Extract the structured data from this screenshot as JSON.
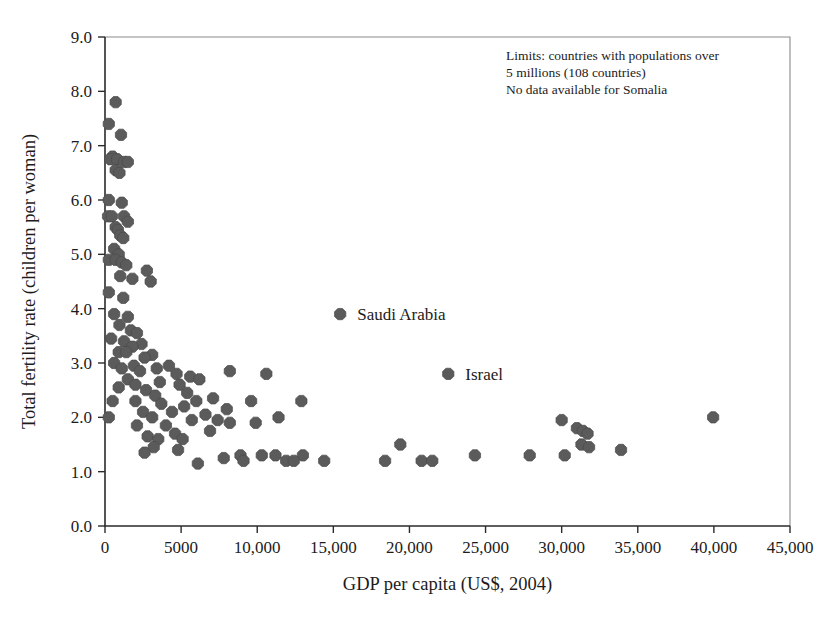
{
  "chart_data": {
    "type": "scatter",
    "title": "",
    "xlabel": "GDP per capita (US$, 2004)",
    "ylabel": "Total fertility rate (children per woman)",
    "xlim": [
      0,
      45000
    ],
    "ylim": [
      0,
      9
    ],
    "grid": false,
    "legend": "none",
    "marker_color": "#5b5b5b",
    "xticks": [
      0,
      5000,
      10000,
      15000,
      20000,
      25000,
      30000,
      35000,
      40000,
      45000
    ],
    "xticklabels": [
      "0",
      "5000",
      "10,000",
      "15,000",
      "20,000",
      "25,000",
      "30,000",
      "35,000",
      "40,000",
      "45,000"
    ],
    "yticks": [
      0,
      1,
      2,
      3,
      4,
      5,
      6,
      7,
      8,
      9
    ],
    "yticklabels": [
      "0.0",
      "1.0",
      "2.0",
      "3.0",
      "4.0",
      "5.0",
      "6.0",
      "7.0",
      "8.0",
      "9.0"
    ],
    "annotation_lines": [
      "Limits: countries with populations over",
      "5 millions (108 countries)",
      "No data available for Somalia"
    ],
    "labeled_points": [
      {
        "name": "Saudi Arabia",
        "x": 15450,
        "y": 3.9
      },
      {
        "name": "Israel",
        "x": 22550,
        "y": 2.8
      }
    ],
    "points": [
      [
        700,
        7.8
      ],
      [
        250,
        7.4
      ],
      [
        1050,
        7.2
      ],
      [
        500,
        6.8
      ],
      [
        350,
        6.75
      ],
      [
        800,
        6.75
      ],
      [
        1250,
        6.7
      ],
      [
        1500,
        6.7
      ],
      [
        700,
        6.55
      ],
      [
        950,
        6.5
      ],
      [
        250,
        6.0
      ],
      [
        1100,
        5.95
      ],
      [
        200,
        5.7
      ],
      [
        450,
        5.7
      ],
      [
        1250,
        5.7
      ],
      [
        1500,
        5.6
      ],
      [
        700,
        5.5
      ],
      [
        850,
        5.45
      ],
      [
        1000,
        5.35
      ],
      [
        1200,
        5.3
      ],
      [
        600,
        5.1
      ],
      [
        900,
        5.0
      ],
      [
        250,
        4.9
      ],
      [
        700,
        4.9
      ],
      [
        1100,
        4.85
      ],
      [
        1400,
        4.8
      ],
      [
        2750,
        4.7
      ],
      [
        1000,
        4.6
      ],
      [
        1800,
        4.55
      ],
      [
        3000,
        4.5
      ],
      [
        250,
        4.3
      ],
      [
        1200,
        4.2
      ],
      [
        600,
        3.9
      ],
      [
        1500,
        3.85
      ],
      [
        950,
        3.7
      ],
      [
        1700,
        3.6
      ],
      [
        2100,
        3.55
      ],
      [
        400,
        3.45
      ],
      [
        1250,
        3.4
      ],
      [
        2400,
        3.35
      ],
      [
        1800,
        3.3
      ],
      [
        900,
        3.2
      ],
      [
        1400,
        3.2
      ],
      [
        3100,
        3.15
      ],
      [
        2600,
        3.1
      ],
      [
        600,
        3.0
      ],
      [
        1900,
        2.95
      ],
      [
        4200,
        2.95
      ],
      [
        1100,
        2.9
      ],
      [
        3400,
        2.9
      ],
      [
        2300,
        2.85
      ],
      [
        8200,
        2.85
      ],
      [
        4700,
        2.8
      ],
      [
        10600,
        2.8
      ],
      [
        5600,
        2.75
      ],
      [
        1500,
        2.7
      ],
      [
        6200,
        2.7
      ],
      [
        3600,
        2.65
      ],
      [
        2000,
        2.6
      ],
      [
        4900,
        2.6
      ],
      [
        900,
        2.55
      ],
      [
        2700,
        2.5
      ],
      [
        5400,
        2.45
      ],
      [
        3300,
        2.4
      ],
      [
        7100,
        2.35
      ],
      [
        500,
        2.3
      ],
      [
        2000,
        2.3
      ],
      [
        6000,
        2.3
      ],
      [
        9600,
        2.3
      ],
      [
        12900,
        2.3
      ],
      [
        3700,
        2.25
      ],
      [
        5200,
        2.2
      ],
      [
        8000,
        2.15
      ],
      [
        2500,
        2.1
      ],
      [
        4400,
        2.1
      ],
      [
        6600,
        2.05
      ],
      [
        250,
        2.0
      ],
      [
        3100,
        2.0
      ],
      [
        5700,
        1.95
      ],
      [
        7400,
        1.95
      ],
      [
        11400,
        2.0
      ],
      [
        30000,
        1.95
      ],
      [
        39950,
        2.0
      ],
      [
        2100,
        1.85
      ],
      [
        4000,
        1.85
      ],
      [
        8200,
        1.9
      ],
      [
        9900,
        1.9
      ],
      [
        31000,
        1.8
      ],
      [
        31400,
        1.75
      ],
      [
        4600,
        1.7
      ],
      [
        6900,
        1.75
      ],
      [
        31700,
        1.7
      ],
      [
        2800,
        1.65
      ],
      [
        3500,
        1.6
      ],
      [
        5100,
        1.6
      ],
      [
        31300,
        1.5
      ],
      [
        31800,
        1.45
      ],
      [
        33900,
        1.4
      ],
      [
        19400,
        1.5
      ],
      [
        3200,
        1.45
      ],
      [
        4800,
        1.4
      ],
      [
        2600,
        1.35
      ],
      [
        8900,
        1.3
      ],
      [
        10300,
        1.3
      ],
      [
        11200,
        1.3
      ],
      [
        13000,
        1.3
      ],
      [
        24300,
        1.3
      ],
      [
        27900,
        1.3
      ],
      [
        30200,
        1.3
      ],
      [
        6100,
        1.15
      ],
      [
        9100,
        1.2
      ],
      [
        11900,
        1.2
      ],
      [
        12400,
        1.2
      ],
      [
        14400,
        1.2
      ],
      [
        18400,
        1.2
      ],
      [
        20800,
        1.2
      ],
      [
        21500,
        1.2
      ],
      [
        7800,
        1.25
      ]
    ]
  },
  "figure": {
    "plot_left": 105,
    "plot_right": 790,
    "plot_top": 37,
    "plot_bottom": 526
  }
}
